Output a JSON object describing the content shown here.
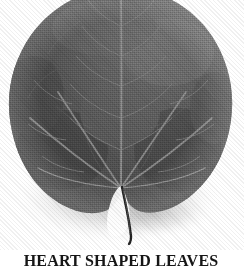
{
  "figure": {
    "caption": "HEART SHAPED LEAVES",
    "background_color": "#ffffff",
    "caption_color": "#161616"
  },
  "leaf": {
    "alt_label": "heart-shaped-leaf-photo",
    "blade_color_dark": "#3f3f3f",
    "blade_color_mid": "#575757",
    "blade_color_light": "#6e6e6e",
    "vein_color": "#8d8d8d",
    "petiole_color": "#2a2a2a",
    "shadow_color": "#c9c9c9",
    "midrib_label": "midrib",
    "petiole_label": "petiole",
    "vein_count": 7,
    "apex_label": "apex",
    "lobe_left_label": "left-basal-lobe",
    "lobe_right_label": "right-basal-lobe"
  }
}
